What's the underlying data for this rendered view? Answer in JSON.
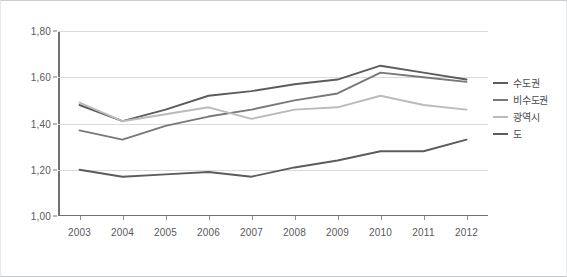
{
  "chart_data": {
    "type": "line",
    "title": "",
    "xlabel": "",
    "ylabel": "",
    "x": [
      "2003",
      "2004",
      "2005",
      "2006",
      "2007",
      "2008",
      "2009",
      "2010",
      "2011",
      "2012"
    ],
    "ylim": [
      1.0,
      1.8
    ],
    "ytick_labels": [
      "1,00",
      "1,20",
      "1,40",
      "1,60",
      "1,80"
    ],
    "ytick_values": [
      1.0,
      1.2,
      1.4,
      1.6,
      1.8
    ],
    "grid": true,
    "legend_position": "right",
    "series": [
      {
        "name": "수도권",
        "color": "#5a5c5e",
        "values": [
          1.48,
          1.41,
          1.46,
          1.52,
          1.54,
          1.57,
          1.59,
          1.65,
          1.62,
          1.59
        ]
      },
      {
        "name": "비수도권",
        "color": "#76787a",
        "values": [
          1.37,
          1.33,
          1.39,
          1.43,
          1.46,
          1.5,
          1.53,
          1.62,
          1.6,
          1.58
        ]
      },
      {
        "name": "광역시",
        "color": "#b9bbbd",
        "values": [
          1.49,
          1.41,
          1.44,
          1.47,
          1.42,
          1.46,
          1.47,
          1.52,
          1.48,
          1.46
        ]
      },
      {
        "name": "도",
        "color": "#5a5c5e",
        "values": [
          1.2,
          1.17,
          1.18,
          1.19,
          1.17,
          1.21,
          1.24,
          1.28,
          1.28,
          1.33
        ]
      }
    ]
  },
  "colors": {
    "grid": "#d9dadc",
    "axis": "#6f7173",
    "tick_text": "#58595b",
    "legend_text": "#4a4b4d",
    "background": "#ffffff"
  }
}
